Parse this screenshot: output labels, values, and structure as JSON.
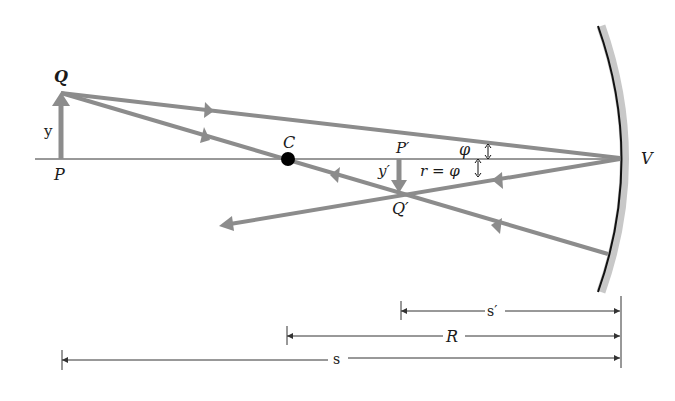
{
  "diagram": {
    "colors": {
      "ray": "#8c8c8c",
      "axis": "#333333",
      "mirror_line": "#111111",
      "mirror_back": "#c8c8c8",
      "center_dot": "#000000",
      "text": "#1a1a1a"
    },
    "labels": {
      "object_top": "Q",
      "object_base": "P",
      "object_height": "y",
      "center": "C",
      "image_base": "P′",
      "image_top": "Q′",
      "image_height": "y′",
      "incident_angle": "φ",
      "reflected_angle": "r = φ",
      "vertex": "V"
    },
    "dimensions": {
      "image_distance": "s′",
      "radius": "R",
      "object_distance": "s"
    }
  }
}
